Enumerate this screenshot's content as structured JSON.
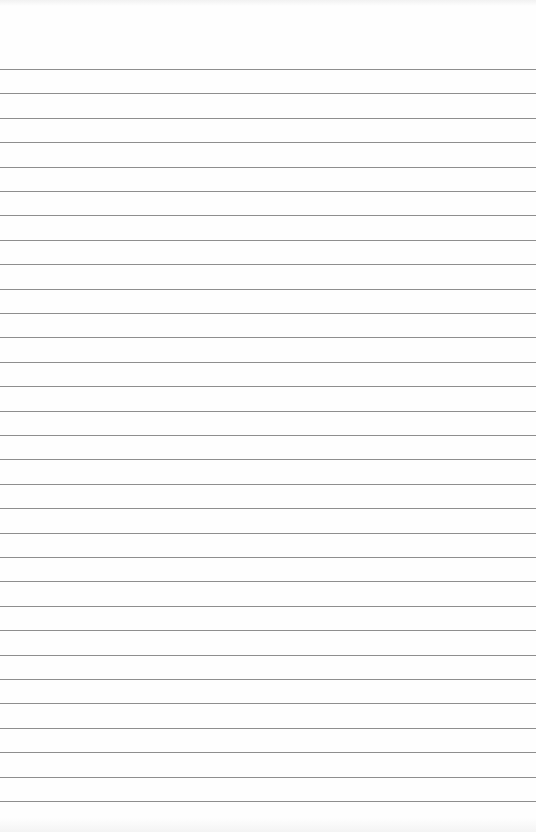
{
  "document": {
    "type": "lined-paper",
    "text": "",
    "rule_color": "#8e8e8e",
    "background_color": "#fefefe",
    "rule_count": 31
  }
}
